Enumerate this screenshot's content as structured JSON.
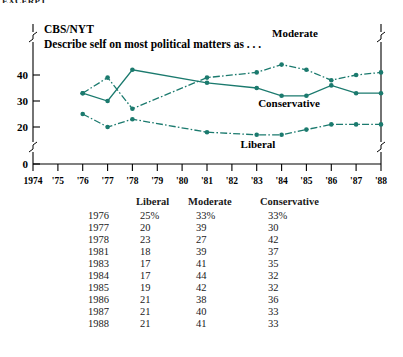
{
  "top_clipped_caption": "EXCERPT",
  "chart_data": {
    "type": "line",
    "title": "CBS/NYT",
    "subtitle": "Describe self on most political matters as . . .",
    "xlabel": "",
    "ylabel": "",
    "grid": false,
    "legend_position": "inline-annotation",
    "accent_color": "#1b7a6e",
    "axis_break": true,
    "ylim": [
      0,
      46
    ],
    "y_ticks": [
      0,
      20,
      30,
      40
    ],
    "x_ticks": [
      "1974",
      "'75",
      "'76",
      "'77",
      "'78",
      "'79",
      "'80",
      "'81",
      "'82",
      "'83",
      "'84",
      "'85",
      "'86",
      "'87",
      "'88"
    ],
    "x": [
      1976,
      1977,
      1978,
      1981,
      1983,
      1984,
      1985,
      1986,
      1987,
      1988
    ],
    "series": [
      {
        "name": "Liberal",
        "style": "dash-dot",
        "values": [
          25,
          20,
          23,
          18,
          17,
          17,
          19,
          21,
          21,
          21
        ]
      },
      {
        "name": "Moderate",
        "style": "dash-dot",
        "values": [
          33,
          39,
          27,
          39,
          41,
          44,
          42,
          38,
          40,
          41
        ]
      },
      {
        "name": "Conservative",
        "style": "solid",
        "values": [
          33,
          30,
          42,
          37,
          35,
          32,
          32,
          36,
          33,
          33
        ]
      }
    ],
    "annotations": [
      {
        "text": "Moderate",
        "series": "Moderate"
      },
      {
        "text": "Conservative",
        "series": "Conservative"
      },
      {
        "text": "Liberal",
        "series": "Liberal"
      }
    ]
  },
  "table": {
    "headers": [
      "",
      "Liberal",
      "Moderate",
      "Conservative"
    ],
    "rows": [
      {
        "year": "1976",
        "liberal": "25%",
        "moderate": "33%",
        "conservative": "33%"
      },
      {
        "year": "1977",
        "liberal": "20",
        "moderate": "39",
        "conservative": "30"
      },
      {
        "year": "1978",
        "liberal": "23",
        "moderate": "27",
        "conservative": "42"
      },
      {
        "year": "1981",
        "liberal": "18",
        "moderate": "39",
        "conservative": "37"
      },
      {
        "year": "1983",
        "liberal": "17",
        "moderate": "41",
        "conservative": "35"
      },
      {
        "year": "1984",
        "liberal": "17",
        "moderate": "44",
        "conservative": "32"
      },
      {
        "year": "1985",
        "liberal": "19",
        "moderate": "42",
        "conservative": "32"
      },
      {
        "year": "1986",
        "liberal": "21",
        "moderate": "38",
        "conservative": "36"
      },
      {
        "year": "1987",
        "liberal": "21",
        "moderate": "40",
        "conservative": "33"
      },
      {
        "year": "1988",
        "liberal": "21",
        "moderate": "41",
        "conservative": "33"
      }
    ]
  }
}
